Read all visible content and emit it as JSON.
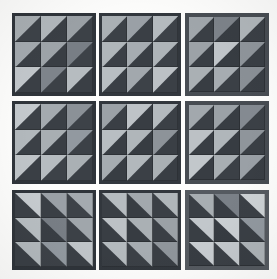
{
  "artwork": {
    "title": "Half-Square Triangle Quilt Grid",
    "description": "Nine square blocks arranged in a 3 by 3 layout; each block contains a 3 by 3 grid of half-square triangle units.",
    "canvas": {
      "width": 277,
      "height": 279,
      "background_color": "#fdfdfc"
    },
    "grid": {
      "block_rows": 3,
      "block_cols": 3,
      "cells_per_block_rows": 3,
      "cells_per_block_cols": 3
    },
    "palette": {
      "background": "#fdfdfc",
      "dark_navy": "#3a3f45",
      "dark_slate": "#41464c",
      "dark_charcoal": "#34383d",
      "mid_gray": "#6e737a",
      "light_gray": "#9aa0a5",
      "pale_gray": "#b9bec2",
      "bright_gray": "#cbd0d3",
      "frame_dark": "#2f343a",
      "frame_light": "#70767c"
    },
    "blocks": [
      {
        "name": "block-r1c1",
        "row": 1,
        "col": 1,
        "x": 12,
        "y": 13,
        "w": 84,
        "h": 83,
        "frame_color": "#2f343a",
        "frame_width": 3,
        "orientation": "hyp-bl-tr",
        "cells": [
          {
            "bg": "#3d4248",
            "tri": "#a8aeb2"
          },
          {
            "bg": "#3a3f45",
            "tri": "#b2b8bc"
          },
          {
            "bg": "#3c4147",
            "tri": "#9ba1a6"
          },
          {
            "bg": "#3b4046",
            "tri": "#a4aaaf"
          },
          {
            "bg": "#393e44",
            "tri": "#9ea4a9"
          },
          {
            "bg": "#3d4248",
            "tri": "#787e85"
          },
          {
            "bg": "#3a3f45",
            "tri": "#c2c7cb"
          },
          {
            "bg": "#3c4147",
            "tri": "#7e848b"
          },
          {
            "bg": "#3a3f45",
            "tri": "#b6bcc0"
          }
        ]
      },
      {
        "name": "block-r1c2",
        "row": 1,
        "col": 2,
        "x": 99,
        "y": 13,
        "w": 82,
        "h": 83,
        "frame_color": "#32373d",
        "frame_width": 3,
        "orientation": "hyp-bl-tr",
        "cells": [
          {
            "bg": "#3c4147",
            "tri": "#aab0b4"
          },
          {
            "bg": "#3a3f45",
            "tri": "#9aa0a6"
          },
          {
            "bg": "#3d4248",
            "tri": "#b4babe"
          },
          {
            "bg": "#3b4046",
            "tri": "#b0b6ba"
          },
          {
            "bg": "#393e44",
            "tri": "#a6acb1"
          },
          {
            "bg": "#3c4147",
            "tri": "#aeb4b8"
          },
          {
            "bg": "#3a3f45",
            "tri": "#b8bec2"
          },
          {
            "bg": "#3d4248",
            "tri": "#a2a8ad"
          },
          {
            "bg": "#3b4046",
            "tri": "#bcc1c5"
          }
        ]
      },
      {
        "name": "block-r1c3",
        "row": 1,
        "col": 3,
        "x": 185,
        "y": 13,
        "w": 84,
        "h": 83,
        "frame_color": "#484d53",
        "frame_width": 4,
        "orientation": "hyp-bl-tr",
        "cells": [
          {
            "bg": "#3a3f45",
            "tri": "#a0a6ab"
          },
          {
            "bg": "#383d43",
            "tri": "#7d838a"
          },
          {
            "bg": "#3b4046",
            "tri": "#b0b6ba"
          },
          {
            "bg": "#393e44",
            "tri": "#9ca2a7"
          },
          {
            "bg": "#373c42",
            "tri": "#c0c5c9"
          },
          {
            "bg": "#3a3f45",
            "tri": "#8f959b"
          },
          {
            "bg": "#383d43",
            "tri": "#aab0b4"
          },
          {
            "bg": "#3b4046",
            "tri": "#a6acb1"
          },
          {
            "bg": "#393e44",
            "tri": "#8a9096"
          }
        ]
      },
      {
        "name": "block-r2c1",
        "row": 2,
        "col": 1,
        "x": 12,
        "y": 101,
        "w": 84,
        "h": 83,
        "frame_color": "#2f343a",
        "frame_width": 3,
        "orientation": "hyp-bl-tr",
        "cells": [
          {
            "bg": "#3c4147",
            "tri": "#c4c9cd"
          },
          {
            "bg": "#3a3f45",
            "tri": "#a4aaaf"
          },
          {
            "bg": "#3d4248",
            "tri": "#8b9197"
          },
          {
            "bg": "#3b4046",
            "tri": "#b2b8bc"
          },
          {
            "bg": "#393e44",
            "tri": "#a8aeb2"
          },
          {
            "bg": "#3c4147",
            "tri": "#9299a0"
          },
          {
            "bg": "#3a3f45",
            "tri": "#bfc4c8"
          },
          {
            "bg": "#3d4248",
            "tri": "#b6bcc0"
          },
          {
            "bg": "#3b4046",
            "tri": "#aab0b4"
          }
        ]
      },
      {
        "name": "block-r2c2",
        "row": 2,
        "col": 2,
        "x": 99,
        "y": 101,
        "w": 82,
        "h": 83,
        "frame_color": "#32373d",
        "frame_width": 3,
        "orientation": "hyp-bl-tr",
        "cells": [
          {
            "bg": "#3a3f45",
            "tri": "#9ca2a7"
          },
          {
            "bg": "#383d43",
            "tri": "#bec3c7"
          },
          {
            "bg": "#3b4046",
            "tri": "#b4babe"
          },
          {
            "bg": "#393e44",
            "tri": "#b8bec2"
          },
          {
            "bg": "#373c42",
            "tri": "#b0b6ba"
          },
          {
            "bg": "#3a3f45",
            "tri": "#8d9399"
          },
          {
            "bg": "#383d43",
            "tri": "#a6acb1"
          },
          {
            "bg": "#3b4046",
            "tri": "#b2b8bc"
          },
          {
            "bg": "#393e44",
            "tri": "#aab0b4"
          }
        ]
      },
      {
        "name": "block-r2c3",
        "row": 2,
        "col": 3,
        "x": 185,
        "y": 101,
        "w": 84,
        "h": 83,
        "frame_color": "#474c52",
        "frame_width": 4,
        "orientation": "hyp-bl-tr",
        "cells": [
          {
            "bg": "#3a3f45",
            "tri": "#a2a8ad"
          },
          {
            "bg": "#383d43",
            "tri": "#9ba1a6"
          },
          {
            "bg": "#3b4046",
            "tri": "#848a91"
          },
          {
            "bg": "#393e44",
            "tri": "#bcc1c5"
          },
          {
            "bg": "#373c42",
            "tri": "#b0b6ba"
          },
          {
            "bg": "#3a3f45",
            "tri": "#8f959b"
          },
          {
            "bg": "#383d43",
            "tri": "#c2c7cb"
          },
          {
            "bg": "#3b4046",
            "tri": "#a8aeb2"
          },
          {
            "bg": "#393e44",
            "tri": "#9aa0a6"
          }
        ]
      },
      {
        "name": "block-r3c1",
        "row": 3,
        "col": 1,
        "x": 12,
        "y": 190,
        "w": 84,
        "h": 80,
        "frame_color": "#2f343a",
        "frame_width": 3,
        "orientation": "hyp-tl-br",
        "cells": [
          {
            "bg": "#3c4147",
            "tri": "#c6cbcf"
          },
          {
            "bg": "#3a3f45",
            "tri": "#9aa0a6"
          },
          {
            "bg": "#3d4248",
            "tri": "#a4aaaf"
          },
          {
            "bg": "#3b4046",
            "tri": "#b8bec2"
          },
          {
            "bg": "#393e44",
            "tri": "#787e85"
          },
          {
            "bg": "#3c4147",
            "tri": "#a0a6ab"
          },
          {
            "bg": "#3a3f45",
            "tri": "#b2b8bc"
          },
          {
            "bg": "#3d4248",
            "tri": "#9299a0"
          },
          {
            "bg": "#3b4046",
            "tri": "#c0c5c9"
          }
        ]
      },
      {
        "name": "block-r3c2",
        "row": 3,
        "col": 2,
        "x": 99,
        "y": 190,
        "w": 82,
        "h": 80,
        "frame_color": "#32373d",
        "frame_width": 3,
        "orientation": "hyp-tl-br",
        "cells": [
          {
            "bg": "#3a3f45",
            "tri": "#b6bcc0"
          },
          {
            "bg": "#383d43",
            "tri": "#a2a8ad"
          },
          {
            "bg": "#3b4046",
            "tri": "#b0b6ba"
          },
          {
            "bg": "#393e44",
            "tri": "#bcc1c5"
          },
          {
            "bg": "#373c42",
            "tri": "#aab0b4"
          },
          {
            "bg": "#3a3f45",
            "tri": "#9ba1a6"
          },
          {
            "bg": "#383d43",
            "tri": "#b4babe"
          },
          {
            "bg": "#3b4046",
            "tri": "#a6acb1"
          },
          {
            "bg": "#393e44",
            "tri": "#8f959b"
          }
        ]
      },
      {
        "name": "block-r3c3",
        "row": 3,
        "col": 3,
        "x": 185,
        "y": 190,
        "w": 84,
        "h": 80,
        "frame_color": "#555a60",
        "frame_width": 4,
        "orientation": "hyp-tl-br",
        "cells": [
          {
            "bg": "#3a3f45",
            "tri": "#a8aeb2"
          },
          {
            "bg": "#383d43",
            "tri": "#7a8087"
          },
          {
            "bg": "#3b4046",
            "tri": "#cdd2d5"
          },
          {
            "bg": "#393e44",
            "tri": "#c2c7cb"
          },
          {
            "bg": "#373c42",
            "tri": "#cbd0d3"
          },
          {
            "bg": "#3a3f45",
            "tri": "#9299a0"
          },
          {
            "bg": "#383d43",
            "tri": "#c8cdd1"
          },
          {
            "bg": "#3b4046",
            "tri": "#c4c9cd"
          },
          {
            "bg": "#393e44",
            "tri": "#aeb4b8"
          }
        ]
      }
    ]
  }
}
